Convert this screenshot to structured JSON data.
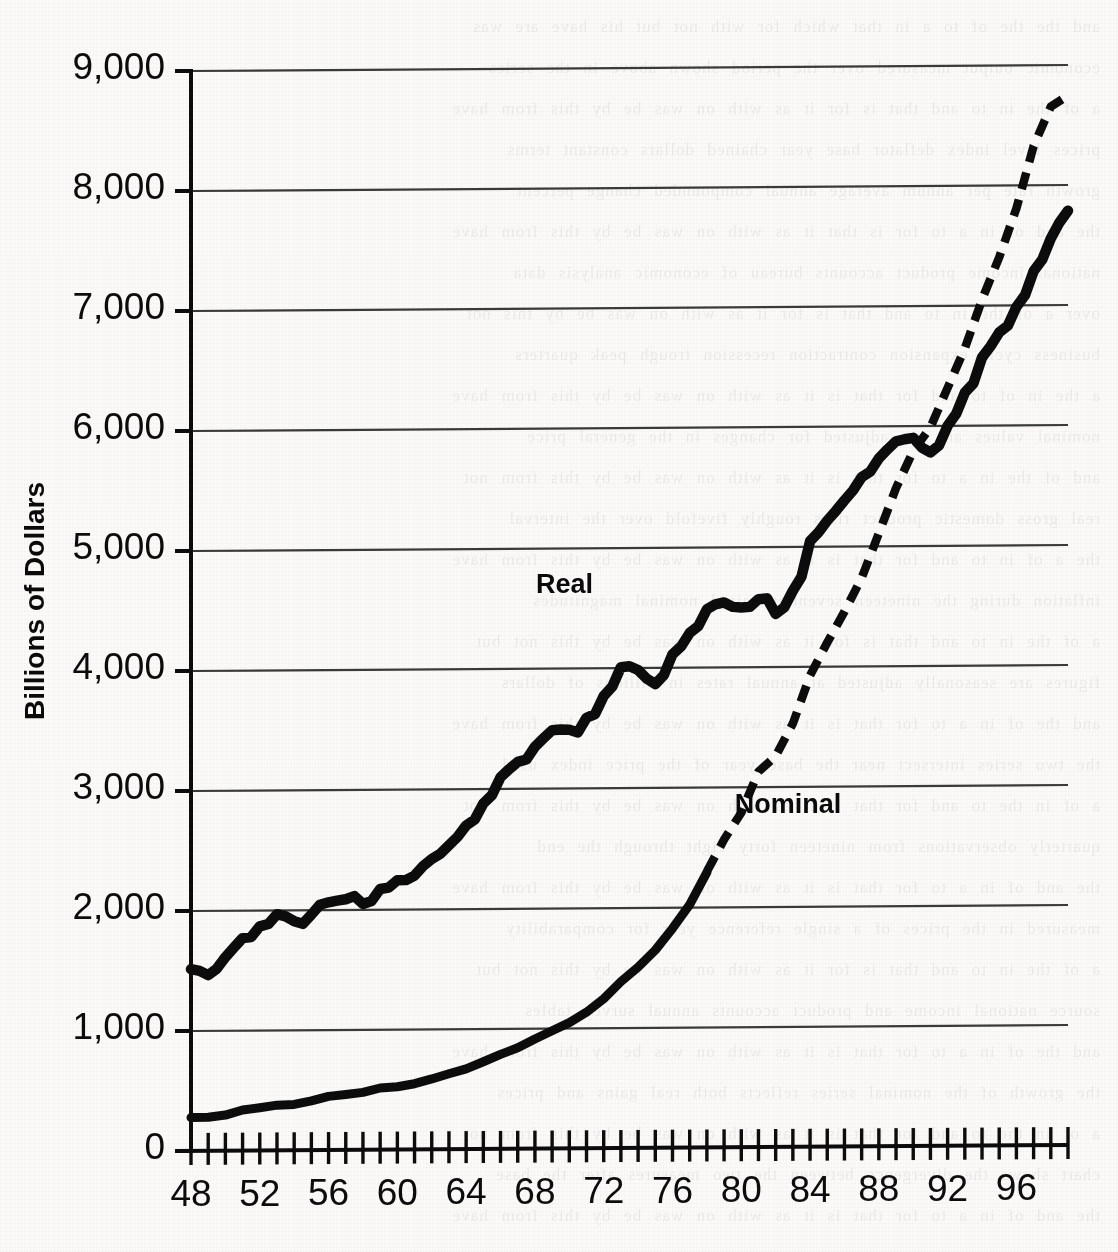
{
  "figure": {
    "background_color": "#fbfaf8",
    "ink_color": "#0c0c0c",
    "gridline_color": "#3a3a38"
  },
  "axis_title": {
    "y": "Billions of Dollars"
  },
  "series_labels": {
    "real": "Real",
    "nominal": "Nominal"
  },
  "ghost_text": {
    "lines": [
      "and the the of to a in that which for with not but his have are was",
      "economic output measured over the period shown above in the series",
      "a of the in to and that is for it as with on was be by this from have",
      "prices level index deflator base year chained dollars constant terms",
      "growth rate per annum average annual compounded change percent",
      "the and of in a to for is that it as with on was be by this from have",
      "national income product accounts bureau of economic analysis data",
      "over a of the in to and that is for it as with on was be by this not",
      "business cycle expansion contraction recession trough peak quarters",
      "a the in of to and for that is it as with on was be by this from have",
      "nominal values are not adjusted for changes in the general price",
      "and of the in a to for that is it as with on was be by this from not",
      "real gross domestic product rises roughly fivefold over the interval",
      "the a of in to and for that is it as with on was be by this from have",
      "inflation during the nineteen seventies raised nominal magnitudes",
      "a of the in to and that is for it as with on was be by this not but",
      "figures are seasonally adjusted at annual rates in billions of dollars",
      "and the of in a to for that is it as with on was be by this from have",
      "the two series intersect near the base year of the price index used",
      "a of in the to and for that is it as with on was be by this from not",
      "quarterly observations from nineteen forty eight through the end",
      "the and of in a to for that is it as with on was be by this from have",
      "measured in the prices of a single reference year for comparability",
      "a of the in to and that is for it as with on was be by this not but",
      "source national income and product accounts annual survey tables",
      "and the of in a to for that is it as with on was be by this from have",
      "the growth of the nominal series reflects both real gains and prices",
      "a of in the to and for that is it as with on was be by this from not",
      "chart shows the divergence between the two measures after the base",
      "the and of in a to for that is it as with on was be by this from have"
    ]
  },
  "chart_data": {
    "type": "line",
    "title": "",
    "xlabel": "",
    "ylabel": "Billions of Dollars",
    "xlim": [
      48,
      99
    ],
    "ylim": [
      0,
      9000
    ],
    "grid": true,
    "grid_axis": "y",
    "legend_position": "inline-annotation",
    "y_ticks": [
      0,
      1000,
      2000,
      3000,
      4000,
      5000,
      6000,
      7000,
      8000,
      9000
    ],
    "y_tick_labels": [
      "0",
      "1,000",
      "2,000",
      "3,000",
      "4,000",
      "5,000",
      "6,000",
      "7,000",
      "8,000",
      "9,000"
    ],
    "x_ticks": [
      48,
      49,
      50,
      51,
      52,
      53,
      54,
      55,
      56,
      57,
      58,
      59,
      60,
      61,
      62,
      63,
      64,
      65,
      66,
      67,
      68,
      69,
      70,
      71,
      72,
      73,
      74,
      75,
      76,
      77,
      78,
      79,
      80,
      81,
      82,
      83,
      84,
      85,
      86,
      87,
      88,
      89,
      90,
      91,
      92,
      93,
      94,
      95,
      96,
      97,
      98,
      99
    ],
    "x_tick_labels_shown": [
      "48",
      "52",
      "56",
      "60",
      "64",
      "68",
      "72",
      "76",
      "80",
      "84",
      "88",
      "92",
      "96"
    ],
    "x_label_interval": 4,
    "series": [
      {
        "name": "Real",
        "style": "solid",
        "linewidth": 9,
        "x": [
          48,
          48.5,
          49,
          49.5,
          50,
          50.5,
          51,
          51.5,
          52,
          52.5,
          53,
          53.5,
          54,
          54.5,
          55,
          55.5,
          56,
          56.5,
          57,
          57.5,
          58,
          58.5,
          59,
          59.5,
          60,
          60.5,
          61,
          61.5,
          62,
          62.5,
          63,
          63.5,
          64,
          64.5,
          65,
          65.5,
          66,
          66.5,
          67,
          67.5,
          68,
          68.5,
          69,
          69.5,
          70,
          70.5,
          71,
          71.5,
          72,
          72.5,
          73,
          73.5,
          74,
          74.5,
          75,
          75.5,
          76,
          76.5,
          77,
          77.5,
          78,
          78.5,
          79,
          79.5,
          80,
          80.5,
          81,
          81.5,
          82,
          82.5,
          83,
          83.5,
          84,
          84.5,
          85,
          85.5,
          86,
          86.5,
          87,
          87.5,
          88,
          88.5,
          89,
          89.5,
          90,
          90.5,
          91,
          91.5,
          92,
          92.5,
          93,
          93.5,
          94,
          94.5,
          95,
          95.5,
          96,
          96.5,
          97,
          97.5,
          98,
          98.5,
          99
        ],
        "values": [
          1500,
          1490,
          1470,
          1520,
          1620,
          1700,
          1780,
          1800,
          1860,
          1900,
          1960,
          1950,
          1930,
          1900,
          1980,
          2050,
          2080,
          2090,
          2110,
          2120,
          2060,
          2100,
          2180,
          2200,
          2260,
          2270,
          2300,
          2380,
          2460,
          2510,
          2570,
          2640,
          2740,
          2810,
          2930,
          3010,
          3170,
          3220,
          3280,
          3310,
          3430,
          3500,
          3580,
          3590,
          3590,
          3580,
          3680,
          3740,
          3880,
          3980,
          4130,
          4150,
          4120,
          4050,
          4000,
          4080,
          4260,
          4340,
          4450,
          4540,
          4680,
          4720,
          4750,
          4700,
          4690,
          4700,
          4800,
          4780,
          4680,
          4720,
          4880,
          5010,
          5320,
          5400,
          5520,
          5600,
          5700,
          5780,
          5900,
          5980,
          6110,
          6170,
          6250,
          6280,
          6300,
          6230,
          6190,
          6250,
          6420,
          6550,
          6730,
          6850,
          7070,
          7200,
          7310,
          7400,
          7550,
          7680,
          7900,
          8020,
          8200,
          8350,
          8500
        ],
        "values_axis_note": "Real series shown in chart tops out near 7,800 at right edge"
      },
      {
        "name": "Nominal",
        "style": "dashed-upper",
        "linewidth": 9,
        "x": [
          48,
          49,
          50,
          51,
          52,
          53,
          54,
          55,
          56,
          57,
          58,
          59,
          60,
          61,
          62,
          63,
          64,
          65,
          66,
          67,
          68,
          69,
          70,
          71,
          72,
          73,
          74,
          75,
          76,
          77,
          78,
          79,
          80,
          81,
          82,
          83,
          84,
          85,
          86,
          87,
          88,
          89,
          90,
          91,
          92,
          93,
          94,
          95,
          96,
          97,
          98,
          99
        ],
        "values": [
          270,
          275,
          300,
          340,
          360,
          380,
          385,
          420,
          440,
          465,
          470,
          510,
          530,
          550,
          590,
          625,
          670,
          725,
          790,
          835,
          910,
          985,
          1040,
          1130,
          1240,
          1385,
          1500,
          1640,
          1830,
          2030,
          2290,
          2560,
          2790,
          3130,
          3260,
          3530,
          3930,
          4210,
          4450,
          4740,
          5100,
          5480,
          5800,
          5990,
          6320,
          6640,
          7050,
          7400,
          7810,
          8320,
          8650,
          8750
        ]
      }
    ],
    "annotations": [
      {
        "text": "Real",
        "x": 70.5,
        "y": 4650
      },
      {
        "text": "Nominal",
        "x": 83.0,
        "y": 2820
      }
    ]
  }
}
